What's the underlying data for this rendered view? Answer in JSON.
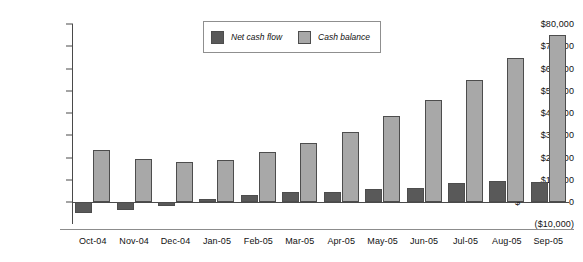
{
  "chart_data": {
    "type": "bar",
    "title": "",
    "subtitle": "",
    "xlabel": "",
    "ylabel": "",
    "grid": false,
    "legend_position": "top-center",
    "ylim": [
      -10000,
      80000
    ],
    "y_ticks": [
      {
        "value": 80000,
        "label_currency": "",
        "label": "$80,000"
      },
      {
        "value": 70000,
        "label_currency": "",
        "label": "$70,000"
      },
      {
        "value": 60000,
        "label_currency": "",
        "label": "$60,000"
      },
      {
        "value": 50000,
        "label_currency": "",
        "label": "$50,000"
      },
      {
        "value": 40000,
        "label_currency": "",
        "label": "$40,000"
      },
      {
        "value": 30000,
        "label_currency": "",
        "label": "$30,000"
      },
      {
        "value": 20000,
        "label_currency": "",
        "label": "$20,000"
      },
      {
        "value": 10000,
        "label_currency": "",
        "label": "$10,000"
      },
      {
        "value": 0,
        "label_currency": "$",
        "label": "0"
      },
      {
        "value": -10000,
        "label_currency": "",
        "label": "($10,000)"
      }
    ],
    "categories": [
      "Oct-04",
      "Nov-04",
      "Dec-04",
      "Jan-05",
      "Feb-05",
      "Mar-05",
      "Apr-05",
      "May-05",
      "Jun-05",
      "Jul-05",
      "Aug-05",
      "Sep-05"
    ],
    "series": [
      {
        "name": "Net cash flow",
        "color": "#595959",
        "values": [
          -5000,
          -3800,
          -1800,
          1300,
          3000,
          4300,
          4700,
          6000,
          6300,
          8500,
          9300,
          9100
        ]
      },
      {
        "name": "Cash balance",
        "color": "#a8a8a8",
        "values": [
          23300,
          19400,
          18000,
          19000,
          22600,
          26700,
          31600,
          38500,
          45800,
          54700,
          64500,
          75000
        ]
      }
    ]
  },
  "legend": {
    "items": [
      {
        "label": "Net cash flow",
        "swatch": "dark-gray-swatch"
      },
      {
        "label": "Cash balance",
        "swatch": "light-gray-swatch"
      }
    ]
  }
}
